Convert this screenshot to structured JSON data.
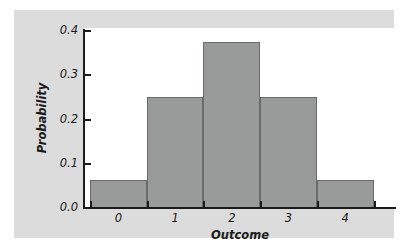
{
  "chart_data": {
    "type": "bar",
    "title": "",
    "subtitle": "",
    "xlabel": "Outcome",
    "ylabel": "Probability",
    "categories": [
      "0",
      "1",
      "2",
      "3",
      "4"
    ],
    "values": [
      0.0625,
      0.25,
      0.375,
      0.25,
      0.0625
    ],
    "series": [
      {
        "name": "Probability",
        "values": [
          0.0625,
          0.25,
          0.375,
          0.25,
          0.0625
        ]
      }
    ],
    "ylim": [
      0.0,
      0.4
    ],
    "ytick_labels": [
      "0.0",
      "0.1",
      "0.2",
      "0.3",
      "0.4"
    ],
    "ytick_values": [
      0.0,
      0.1,
      0.2,
      0.3,
      0.4
    ],
    "xtick_labels": [
      "0",
      "1",
      "2",
      "3",
      "4"
    ],
    "grid": false,
    "legend": false,
    "legend_position": "none",
    "annotations": [],
    "colors": {
      "bar_fill": "#999a9a",
      "bar_outline": "#6b6b6b",
      "axis": "#1b1b1b",
      "panel_background": "#dcdcdc",
      "plot_background": "#ffffff",
      "page_background": "#ffffff"
    }
  }
}
